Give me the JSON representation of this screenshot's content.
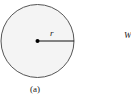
{
  "diagram": {
    "circle": {
      "cx": 37.5,
      "cy": 41,
      "r": 36.5,
      "fill": "#f4f4f4",
      "stroke": "#555555"
    },
    "center_dot": {
      "cx": 37.5,
      "cy": 41,
      "r": 2,
      "fill": "#000000"
    },
    "radius_line": {
      "x1": 37.5,
      "y1": 41,
      "x2": 74,
      "y2": 41,
      "stroke": "#111111"
    },
    "labels": {
      "radius": "r",
      "side": "W",
      "caption": "(a)"
    }
  }
}
